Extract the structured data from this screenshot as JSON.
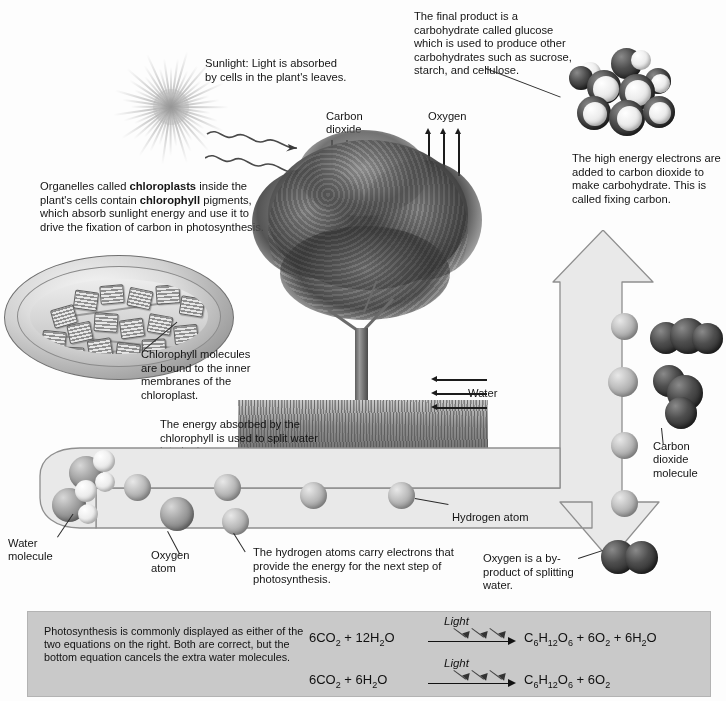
{
  "annotations": {
    "sunlight": "Sunlight: Light is absorbed by cells in the plant's leaves.",
    "final_product": "The final product is a carbohydrate called glucose which is used to produce other carbohydrates such as sucrose, starch, and cellulose.",
    "high_energy_electrons": "The high energy electrons are added to carbon dioxide to make carbohydrate. This is called fixing carbon.",
    "organelles_pre": "Organelles called ",
    "organelles_bold1": "chloroplasts",
    "organelles_mid": " inside the plant's cells contain ",
    "organelles_bold2": "chlorophyll",
    "organelles_post": " pigments, which absorb sunlight energy and use it to drive the fixation of carbon in photosynthesis.",
    "chlorophyll_molecules": "Chlorophyll molecules are bound to the inner membranes of the chloroplast.",
    "energy_absorbed": "The energy absorbed by the chlorophyll is used to split water into hydrogen and oxygen atoms. This process is called photolysis.",
    "hydrogen_carry": "The hydrogen atoms carry electrons that provide the energy for the next step of photosynthesis.",
    "oxygen_byproduct": "Oxygen is a by-product of splitting water."
  },
  "labels": {
    "carbon_dioxide": "Carbon\ndioxide",
    "carbon_dioxide_l1": "Carbon",
    "carbon_dioxide_l2": "dioxide",
    "oxygen": "Oxygen",
    "water": "Water",
    "water_molecule_l1": "Water",
    "water_molecule_l2": "molecule",
    "oxygen_atom_l1": "Oxygen",
    "oxygen_atom_l2": "atom",
    "hydrogen_atom": "Hydrogen atom",
    "co2_molecule_l1": "Carbon",
    "co2_molecule_l2": "dioxide",
    "co2_molecule_l3": "molecule"
  },
  "equation_panel": {
    "note": "Photosynthesis is commonly displayed as either of the two equations on the right. Both are correct, but the bottom equation cancels the extra water molecules.",
    "light_label": "Light",
    "equations": [
      {
        "left_parts": [
          {
            "t": "6CO"
          },
          {
            "t": "2",
            "sub": true
          },
          {
            "t": " + 12H"
          },
          {
            "t": "2",
            "sub": true
          },
          {
            "t": "O"
          }
        ],
        "right_parts": [
          {
            "t": "C"
          },
          {
            "t": "6",
            "sub": true
          },
          {
            "t": "H"
          },
          {
            "t": "12",
            "sub": true
          },
          {
            "t": "O"
          },
          {
            "t": "6",
            "sub": true
          },
          {
            "t": " + 6O"
          },
          {
            "t": "2",
            "sub": true
          },
          {
            "t": " + 6H"
          },
          {
            "t": "2",
            "sub": true
          },
          {
            "t": "O"
          }
        ],
        "left_plain": "6CO2 + 12H2O",
        "right_plain": "C6H12O6 + 6O2 + 6H2O"
      },
      {
        "left_parts": [
          {
            "t": "6CO"
          },
          {
            "t": "2",
            "sub": true
          },
          {
            "t": " + 6H"
          },
          {
            "t": "2",
            "sub": true
          },
          {
            "t": "O"
          }
        ],
        "right_parts": [
          {
            "t": "C"
          },
          {
            "t": "6",
            "sub": true
          },
          {
            "t": "H"
          },
          {
            "t": "12",
            "sub": true
          },
          {
            "t": "O"
          },
          {
            "t": "6",
            "sub": true
          },
          {
            "t": " + 6O"
          },
          {
            "t": "2",
            "sub": true
          }
        ],
        "left_plain": "6CO2 + 6H2O",
        "right_plain": "C6H12O6 + 6O2"
      }
    ]
  },
  "colors": {
    "background": "#fdfdfd",
    "panel_fill": "#c9c9c9",
    "band_fill": "#e4e4e4",
    "band_stroke": "#8f8f8f",
    "text": "#141414",
    "arrow": "#1c1c1c"
  }
}
